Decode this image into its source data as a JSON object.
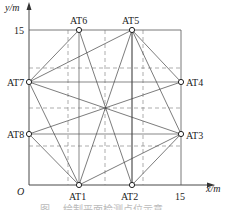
{
  "axes": {
    "y_label": "y/m",
    "x_label": "x/m",
    "origin_label": "O",
    "y_tick": "15",
    "x_tick": "15"
  },
  "points": [
    {
      "id": "AT1",
      "label": "AT1"
    },
    {
      "id": "AT2",
      "label": "AT2"
    },
    {
      "id": "AT3",
      "label": "AT3"
    },
    {
      "id": "AT4",
      "label": "AT4"
    },
    {
      "id": "AT5",
      "label": "AT5"
    },
    {
      "id": "AT6",
      "label": "AT6"
    },
    {
      "id": "AT7",
      "label": "AT7"
    },
    {
      "id": "AT8",
      "label": "AT8"
    }
  ],
  "caption": "图 ... 绘制平面检测点位示意"
}
